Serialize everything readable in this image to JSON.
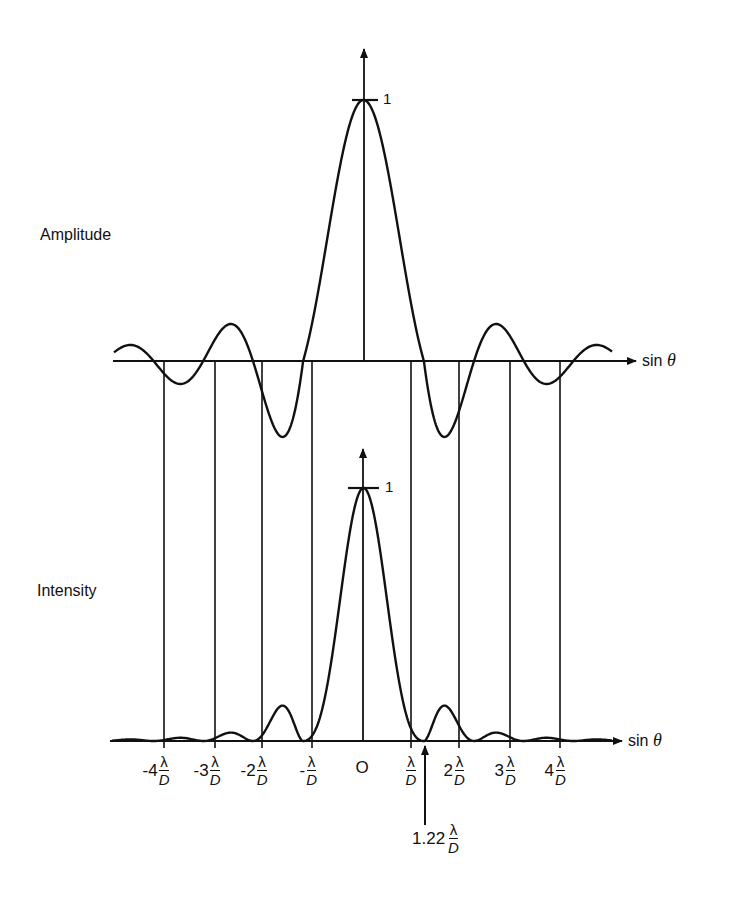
{
  "figure": {
    "top_panel": {
      "label": "Amplitude",
      "peak_label": "1",
      "axis_label": "sin",
      "axis_symbol": "θ"
    },
    "bottom_panel": {
      "label": "Intensity",
      "peak_label": "1",
      "axis_label": "sin",
      "axis_symbol": "θ"
    },
    "x_ticks": [
      {
        "prefix": "-4",
        "num": "λ",
        "den": "D"
      },
      {
        "prefix": "-3",
        "num": "λ",
        "den": "D"
      },
      {
        "prefix": "-2",
        "num": "λ",
        "den": "D"
      },
      {
        "prefix": "-",
        "num": "λ",
        "den": "D"
      },
      {
        "prefix": "O",
        "num": "",
        "den": ""
      },
      {
        "prefix": "",
        "num": "λ",
        "den": "D"
      },
      {
        "prefix": "2",
        "num": "λ",
        "den": "D"
      },
      {
        "prefix": "3",
        "num": "λ",
        "den": "D"
      },
      {
        "prefix": "4",
        "num": "λ",
        "den": "D"
      }
    ],
    "annotation": {
      "prefix": "1.22",
      "num": "λ",
      "den": "D"
    }
  },
  "chart_data": {
    "type": "line",
    "title": "",
    "series": [
      {
        "name": "Amplitude",
        "description": "Airy amplitude pattern 2J1(x)/x vs sin θ",
        "peak": 1,
        "zeros_in_lambda_over_D": [
          -4.24,
          -3.24,
          -2.23,
          -1.22,
          1.22,
          2.23,
          3.24,
          4.24
        ],
        "first_negative_lobe": -0.13,
        "second_positive_lobe": 0.065
      },
      {
        "name": "Intensity",
        "description": "Airy intensity pattern [2J1(x)/x]^2 vs sin θ",
        "peak": 1,
        "first_zero_lambda_over_D": 1.22
      }
    ],
    "x_ticks": [
      "-4λ/D",
      "-3λ/D",
      "-2λ/D",
      "-λ/D",
      "0",
      "λ/D",
      "2λ/D",
      "3λ/D",
      "4λ/D"
    ],
    "xlabel": "sin θ",
    "ylabel_top": "Amplitude",
    "ylabel_bottom": "Intensity",
    "annotations": [
      "1.22 λ/D",
      "1"
    ],
    "grid": "vertical lines at multiples of λ/D",
    "legend": "none"
  }
}
